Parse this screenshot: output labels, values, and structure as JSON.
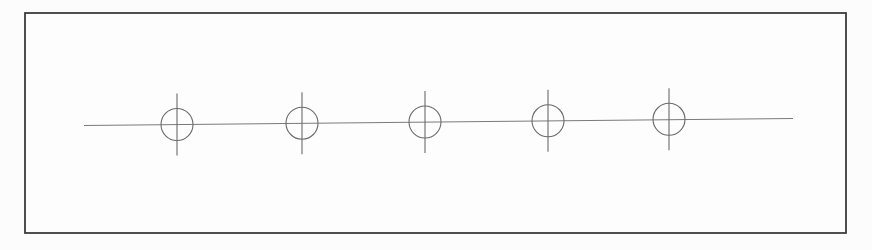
{
  "drawing": {
    "description": "Technical drawing of a rectangular plate with five equally spaced drilled holes on a horizontal centerline, each hole marked by a circle and a vertical center mark",
    "canvas": {
      "width": 872,
      "height": 250,
      "background": "#fcfcfc"
    },
    "plate": {
      "x": 25,
      "y": 13,
      "width": 821,
      "height": 220,
      "stroke": "#3c3c3c",
      "stroke_width": 1.8,
      "fill": "#fdfdfd"
    },
    "centerline": {
      "x1": 84,
      "y1": 125.5,
      "x2": 793,
      "y2": 118.5,
      "stroke": "#7a7a7a",
      "stroke_width": 1
    },
    "holes": {
      "count": 5,
      "radius": 16,
      "crosshair_half_length": 31,
      "stroke": "#6b6b6b",
      "stroke_width": 1.1,
      "centers": [
        {
          "cx": 177,
          "cy": 124.5
        },
        {
          "cx": 302,
          "cy": 123.2
        },
        {
          "cx": 425,
          "cy": 122.0
        },
        {
          "cx": 548,
          "cy": 120.8
        },
        {
          "cx": 669,
          "cy": 119.3
        }
      ]
    }
  }
}
